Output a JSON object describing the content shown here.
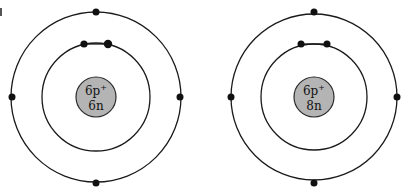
{
  "diagram": {
    "type": "bohr-atom-models",
    "atoms": [
      {
        "id": "carbon-12",
        "nucleus": {
          "protons_label": "6p",
          "proton_charge": "+",
          "neutrons_label": "6n"
        },
        "shells": [
          {
            "level": 1,
            "electrons": 2
          },
          {
            "level": 2,
            "electrons": 4
          }
        ]
      },
      {
        "id": "carbon-14",
        "nucleus": {
          "protons_label": "6p",
          "proton_charge": "+",
          "neutrons_label": "8n"
        },
        "shells": [
          {
            "level": 1,
            "electrons": 2
          },
          {
            "level": 2,
            "electrons": 4
          }
        ]
      }
    ],
    "colors": {
      "nucleus_fill": "#b4b4b4",
      "line": "#1a1a1a",
      "electron": "#111111",
      "background": "#ffffff"
    }
  }
}
